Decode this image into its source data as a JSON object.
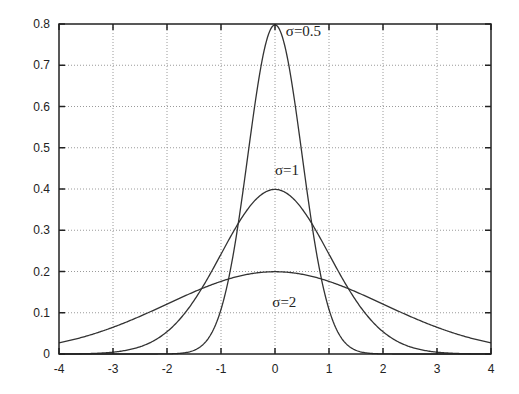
{
  "chart_data": {
    "type": "line",
    "title": "",
    "xlabel": "",
    "ylabel": "",
    "xlim": [
      -4,
      4
    ],
    "ylim": [
      0,
      0.8
    ],
    "grid": true,
    "x_ticks": [
      "-4",
      "-3",
      "-2",
      "-1",
      "0",
      "1",
      "2",
      "3",
      "4"
    ],
    "y_ticks": [
      "0",
      "0.1",
      "0.2",
      "0.3",
      "0.4",
      "0.5",
      "0.6",
      "0.7",
      "0.8"
    ],
    "x_tick_values": [
      -4,
      -3,
      -2,
      -1,
      0,
      1,
      2,
      3,
      4
    ],
    "y_tick_values": [
      0,
      0.1,
      0.2,
      0.3,
      0.4,
      0.5,
      0.6,
      0.7,
      0.8
    ],
    "series": [
      {
        "name": "σ=0.5",
        "sigma": 0.5,
        "peak": 0.798,
        "label_pos": [
          0.2,
          0.77
        ]
      },
      {
        "name": "σ=1",
        "sigma": 1,
        "peak": 0.399,
        "label_pos": [
          0.0,
          0.435
        ]
      },
      {
        "name": "σ=2",
        "sigma": 2,
        "peak": 0.199,
        "label_pos": [
          -0.05,
          0.115
        ]
      }
    ],
    "function": "Gaussian density, mean 0"
  },
  "colors": {
    "curve": "#333333",
    "axis": "#222222",
    "grid": "#9a9a9a"
  }
}
